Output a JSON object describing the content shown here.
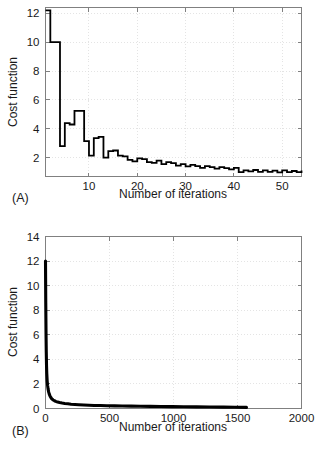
{
  "figure": {
    "background": "#ffffff",
    "line_color": "#000000",
    "axis_color": "#808080",
    "grid_color": "#d8d8d8"
  },
  "panels": [
    {
      "letter": "(A)",
      "ylabel": "Cost function",
      "xlabel": "Number of iterations"
    },
    {
      "letter": "(B)",
      "ylabel": "Cost function",
      "xlabel": "Number of iterations"
    }
  ],
  "chart_data": [
    {
      "type": "line",
      "title": "(A)",
      "xlabel": "Number of iterations",
      "ylabel": "Cost function",
      "xlim": [
        1,
        54
      ],
      "ylim": [
        0.7,
        12.4
      ],
      "xticks": [
        10,
        20,
        30,
        40,
        50
      ],
      "yticks": [
        2,
        4,
        6,
        8,
        10,
        12
      ],
      "grid": true,
      "legend": null,
      "drawstyle": "steps-post",
      "x": [
        1,
        2,
        3,
        4,
        5,
        6,
        7,
        8,
        9,
        10,
        11,
        12,
        13,
        14,
        15,
        16,
        17,
        18,
        19,
        20,
        21,
        22,
        23,
        24,
        25,
        26,
        27,
        28,
        29,
        30,
        31,
        32,
        33,
        34,
        35,
        36,
        37,
        38,
        39,
        40,
        41,
        42,
        43,
        44,
        45,
        46,
        47,
        48,
        49,
        50,
        51,
        52,
        53,
        54
      ],
      "values": [
        12.2,
        10.0,
        10.0,
        2.8,
        4.4,
        4.3,
        5.25,
        5.25,
        3.15,
        2.15,
        3.35,
        3.45,
        2.0,
        2.45,
        2.5,
        2.15,
        2.1,
        1.85,
        1.75,
        1.95,
        1.9,
        1.7,
        1.65,
        1.8,
        1.55,
        1.7,
        1.62,
        1.45,
        1.55,
        1.4,
        1.5,
        1.42,
        1.3,
        1.42,
        1.35,
        1.25,
        1.35,
        1.28,
        1.2,
        1.3,
        1.0,
        1.12,
        1.05,
        1.15,
        1.02,
        1.12,
        1.02,
        1.1,
        0.98,
        1.12,
        1.0,
        1.08,
        1.0,
        1.12
      ]
    },
    {
      "type": "line",
      "title": "(B)",
      "xlabel": "Number of iterations",
      "ylabel": "Cost function",
      "xlim": [
        0,
        2000
      ],
      "ylim": [
        0,
        14
      ],
      "xticks": [
        0,
        500,
        1000,
        1500,
        2000
      ],
      "yticks": [
        0,
        2,
        4,
        6,
        8,
        10,
        12,
        14
      ],
      "grid": true,
      "legend": null,
      "drawstyle": "default",
      "x": [
        0,
        2,
        4,
        6,
        8,
        10,
        13,
        16,
        20,
        25,
        30,
        36,
        43,
        50,
        60,
        70,
        80,
        95,
        110,
        130,
        150,
        175,
        200,
        230,
        260,
        300,
        340,
        380,
        430,
        480,
        540,
        600,
        670,
        740,
        820,
        900,
        990,
        1080,
        1180,
        1280,
        1390,
        1480,
        1570
      ],
      "values": [
        12.0,
        8.6,
        6.2,
        4.6,
        3.5,
        2.85,
        2.25,
        1.9,
        1.6,
        1.33,
        1.15,
        1.0,
        0.87,
        0.78,
        0.69,
        0.63,
        0.58,
        0.52,
        0.48,
        0.44,
        0.41,
        0.38,
        0.35,
        0.33,
        0.31,
        0.29,
        0.27,
        0.25,
        0.24,
        0.22,
        0.21,
        0.2,
        0.19,
        0.18,
        0.17,
        0.16,
        0.15,
        0.14,
        0.13,
        0.12,
        0.11,
        0.1,
        0.09
      ]
    }
  ]
}
